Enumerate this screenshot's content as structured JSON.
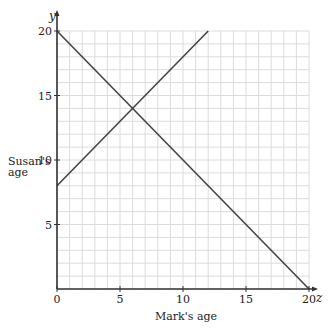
{
  "chart_data": {
    "type": "line",
    "title": "",
    "xlabel": "Mark's age",
    "ylabel": "Susan's age",
    "x_var": "z",
    "y_var": "y",
    "xlim": [
      0,
      20
    ],
    "ylim": [
      0,
      20
    ],
    "xticks": [
      0,
      5,
      10,
      15,
      20
    ],
    "yticks": [
      5,
      10,
      15,
      20
    ],
    "grid": true,
    "grid_step": 1,
    "series": [
      {
        "name": "decreasing line",
        "points": [
          [
            0,
            20
          ],
          [
            20,
            0
          ]
        ]
      },
      {
        "name": "increasing line",
        "points": [
          [
            0,
            8
          ],
          [
            12,
            20
          ]
        ]
      }
    ],
    "intersection": [
      6,
      14
    ]
  },
  "labels": {
    "ylabel_line1": "Susan's",
    "ylabel_line2": "age",
    "xlabel": "Mark's age",
    "origin": "0"
  },
  "colors": {
    "line": "#444444",
    "axis": "#333333",
    "grid": "#dcdcdc"
  }
}
